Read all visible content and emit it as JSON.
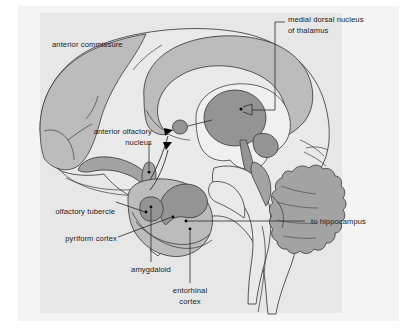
{
  "figure": {
    "panel_background": "#f2f2f2",
    "page_background": "#ffffff",
    "shade_block": "#e6e6e6",
    "colors": {
      "light_gray_structure": "#bcbcbc",
      "mid_gray_structure": "#a3a3a3",
      "dark_gray_structure": "#949494",
      "outline": "#3b3b3b",
      "leader_line": "#2b2b2b",
      "marker_dot": "#000000",
      "label_text": "#1a1a1a"
    }
  },
  "labels": {
    "anterior_commissure": "anterior commissure",
    "medial_dorsal_nucleus_line1": "medial dorsal nucleus",
    "medial_dorsal_nucleus_line2": "of thalamus",
    "anterior_olfactory_nucleus_line1": "anterior olfactory",
    "anterior_olfactory_nucleus_line2": "nucleus",
    "olfactory_tubercle": "olfactory tubercle",
    "pyriform_cortex": "pyriform cortex",
    "amygdaloid": "amygdaloid",
    "entorhinal_cortex_line1": "entorhinal",
    "entorhinal_cortex_line2": "cortex",
    "to_hippocampus": "to hippocampus"
  },
  "structures": [
    {
      "name": "corpus-callosum",
      "shade": "#bcbcbc"
    },
    {
      "name": "thalamus",
      "shade": "#949494"
    },
    {
      "name": "anterior-commissure-body",
      "shade": "#949494"
    },
    {
      "name": "olfactory-bulb-tract",
      "shade": "#a3a3a3"
    },
    {
      "name": "amygdala",
      "shade": "#949494"
    },
    {
      "name": "hippocampal-formation",
      "shade": "#a3a3a3"
    },
    {
      "name": "cerebellum",
      "shade": "#a3a3a3"
    },
    {
      "name": "brainstem",
      "shade": "#a3a3a3"
    },
    {
      "name": "frontal-cortex",
      "shade": "#bcbcbc"
    }
  ]
}
